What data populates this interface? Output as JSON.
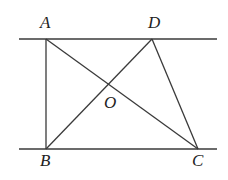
{
  "diagram": {
    "type": "geometry",
    "stroke_color": "#3a3a3a",
    "parallel_lines": [
      {
        "name": "top-line",
        "x1": 19,
        "y1": 39,
        "x2": 217,
        "y2": 39
      },
      {
        "name": "bottom-line",
        "x1": 19,
        "y1": 149,
        "x2": 217,
        "y2": 149
      }
    ],
    "points": {
      "A": {
        "label": "A",
        "x": 46,
        "y": 39
      },
      "D": {
        "label": "D",
        "x": 152,
        "y": 39
      },
      "B": {
        "label": "B",
        "x": 46,
        "y": 149
      },
      "C": {
        "label": "C",
        "x": 198,
        "y": 149
      },
      "O": {
        "label": "O",
        "x": 109,
        "y": 84
      }
    },
    "segments": [
      "AB",
      "AC",
      "BD",
      "DC"
    ]
  }
}
